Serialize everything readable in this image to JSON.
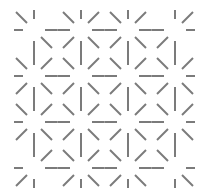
{
  "pattern": {
    "description": "Grid of star nodes with directional spokes",
    "rows": 4,
    "cols": 4,
    "line_color": "#7b7b7b",
    "background_color": "#ffffff",
    "nodes": [
      [
        {
          "spokes": [
            "NW",
            "N",
            "W",
            "E",
            "S",
            "SE"
          ]
        },
        {
          "spokes": [
            "NW",
            "N",
            "NE",
            "W",
            "E",
            "SW",
            "S",
            "SE"
          ]
        },
        {
          "spokes": [
            "NW",
            "N",
            "NE",
            "W",
            "E",
            "SW",
            "S",
            "SE"
          ]
        },
        {
          "spokes": [
            "N",
            "NE",
            "W",
            "E",
            "SW",
            "S"
          ]
        }
      ],
      [
        {
          "spokes": [
            "NW",
            "N",
            "NE",
            "W",
            "E",
            "SW",
            "S",
            "SE"
          ]
        },
        {
          "spokes": [
            "NW",
            "N",
            "NE",
            "W",
            "E",
            "SW",
            "S",
            "SE"
          ]
        },
        {
          "spokes": [
            "NW",
            "N",
            "NE",
            "W",
            "E",
            "SW",
            "S",
            "SE"
          ]
        },
        {
          "spokes": [
            "NW",
            "N",
            "NE",
            "W",
            "E",
            "SW",
            "S",
            "SE"
          ]
        }
      ],
      [
        {
          "spokes": [
            "NW",
            "N",
            "NE",
            "W",
            "E",
            "SW",
            "S",
            "SE"
          ]
        },
        {
          "spokes": [
            "NW",
            "N",
            "NE",
            "W",
            "E",
            "SW",
            "S",
            "SE"
          ]
        },
        {
          "spokes": [
            "NW",
            "N",
            "NE",
            "W",
            "E",
            "SW",
            "S",
            "SE"
          ]
        },
        {
          "spokes": [
            "NW",
            "N",
            "NE",
            "W",
            "E",
            "SW",
            "S",
            "SE"
          ]
        }
      ],
      [
        {
          "spokes": [
            "N",
            "NE",
            "W",
            "E",
            "SW",
            "S"
          ]
        },
        {
          "spokes": [
            "NW",
            "N",
            "NE",
            "W",
            "E",
            "SW",
            "S",
            "SE"
          ]
        },
        {
          "spokes": [
            "NW",
            "N",
            "NE",
            "W",
            "E",
            "SW",
            "S",
            "SE"
          ]
        },
        {
          "spokes": [
            "NW",
            "N",
            "W",
            "E",
            "S",
            "SE"
          ]
        }
      ]
    ]
  }
}
